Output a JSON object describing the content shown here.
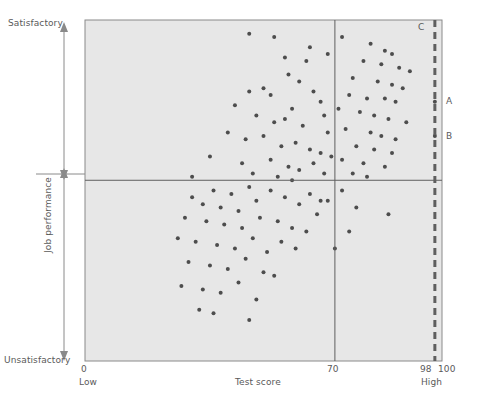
{
  "chart_data": {
    "type": "scatter",
    "title": "",
    "xlabel": "Test score",
    "ylabel": "Job performance",
    "xlim": [
      0,
      100
    ],
    "ylim": [
      0,
      100
    ],
    "grid": false,
    "legend_position": "none",
    "x_tick_labels": [
      "0",
      "70",
      "98",
      "100"
    ],
    "x_tick_values": [
      0,
      70,
      98,
      100
    ],
    "x_axis_low_label": "Low",
    "x_axis_high_label": "High",
    "y_axis_top_label": "Satisfactory",
    "y_axis_bottom_label": "Unsatisfactory",
    "reference_lines": [
      {
        "name": "cutoff-score-line",
        "orientation": "vertical",
        "value": 70,
        "style": "solid"
      },
      {
        "name": "performance-threshold-line",
        "orientation": "horizontal",
        "value": 53,
        "style": "solid"
      },
      {
        "name": "upper-score-line",
        "orientation": "vertical",
        "value": 98,
        "style": "dashed"
      }
    ],
    "annotations": [
      {
        "label": "A",
        "x": 98,
        "y": 76
      },
      {
        "label": "B",
        "x": 98,
        "y": 66
      },
      {
        "label": "C",
        "x": 95,
        "y": 99
      }
    ],
    "points": [
      [
        46,
        96
      ],
      [
        53,
        95
      ],
      [
        56,
        89
      ],
      [
        57,
        84
      ],
      [
        50,
        80
      ],
      [
        63,
        92
      ],
      [
        68,
        90
      ],
      [
        62,
        88
      ],
      [
        46,
        79
      ],
      [
        42,
        75
      ],
      [
        52,
        78
      ],
      [
        60,
        82
      ],
      [
        64,
        79
      ],
      [
        58,
        74
      ],
      [
        66,
        76
      ],
      [
        48,
        72
      ],
      [
        53,
        70
      ],
      [
        56,
        71
      ],
      [
        61,
        69
      ],
      [
        67,
        72
      ],
      [
        40,
        67
      ],
      [
        45,
        65
      ],
      [
        50,
        66
      ],
      [
        55,
        63
      ],
      [
        59,
        64
      ],
      [
        63,
        62
      ],
      [
        66,
        61
      ],
      [
        68,
        67
      ],
      [
        35,
        60
      ],
      [
        44,
        58
      ],
      [
        52,
        59
      ],
      [
        57,
        57
      ],
      [
        60,
        56
      ],
      [
        64,
        58
      ],
      [
        67,
        55
      ],
      [
        69,
        60
      ],
      [
        30,
        54
      ],
      [
        47,
        55
      ],
      [
        54,
        54
      ],
      [
        58,
        53
      ],
      [
        72,
        95
      ],
      [
        80,
        93
      ],
      [
        84,
        91
      ],
      [
        86,
        90
      ],
      [
        78,
        88
      ],
      [
        83,
        87
      ],
      [
        88,
        86
      ],
      [
        91,
        85
      ],
      [
        75,
        83
      ],
      [
        82,
        82
      ],
      [
        86,
        81
      ],
      [
        89,
        80
      ],
      [
        74,
        78
      ],
      [
        79,
        77
      ],
      [
        84,
        77
      ],
      [
        87,
        76
      ],
      [
        98,
        76
      ],
      [
        71,
        74
      ],
      [
        77,
        73
      ],
      [
        81,
        72
      ],
      [
        85,
        71
      ],
      [
        90,
        70
      ],
      [
        98,
        66
      ],
      [
        73,
        68
      ],
      [
        80,
        67
      ],
      [
        83,
        66
      ],
      [
        87,
        65
      ],
      [
        76,
        63
      ],
      [
        81,
        62
      ],
      [
        86,
        61
      ],
      [
        72,
        59
      ],
      [
        78,
        58
      ],
      [
        84,
        57
      ],
      [
        75,
        55
      ],
      [
        79,
        54
      ],
      [
        30,
        48
      ],
      [
        36,
        50
      ],
      [
        41,
        49
      ],
      [
        46,
        51
      ],
      [
        33,
        46
      ],
      [
        38,
        45
      ],
      [
        43,
        44
      ],
      [
        48,
        47
      ],
      [
        52,
        50
      ],
      [
        56,
        48
      ],
      [
        60,
        46
      ],
      [
        63,
        49
      ],
      [
        66,
        47
      ],
      [
        28,
        42
      ],
      [
        34,
        41
      ],
      [
        39,
        40
      ],
      [
        44,
        39
      ],
      [
        49,
        42
      ],
      [
        54,
        41
      ],
      [
        58,
        39
      ],
      [
        62,
        38
      ],
      [
        65,
        43
      ],
      [
        26,
        36
      ],
      [
        31,
        35
      ],
      [
        37,
        34
      ],
      [
        42,
        33
      ],
      [
        47,
        36
      ],
      [
        51,
        32
      ],
      [
        55,
        35
      ],
      [
        59,
        33
      ],
      [
        29,
        29
      ],
      [
        35,
        28
      ],
      [
        40,
        27
      ],
      [
        45,
        30
      ],
      [
        50,
        26
      ],
      [
        53,
        25
      ],
      [
        27,
        22
      ],
      [
        33,
        21
      ],
      [
        38,
        20
      ],
      [
        43,
        23
      ],
      [
        48,
        18
      ],
      [
        32,
        15
      ],
      [
        36,
        14
      ],
      [
        46,
        12
      ],
      [
        72,
        50
      ],
      [
        68,
        47
      ],
      [
        76,
        45
      ],
      [
        85,
        43
      ],
      [
        74,
        38
      ],
      [
        70,
        33
      ]
    ],
    "point_color": "#4d4d4d",
    "plot_bg_color": "#e7e7e7",
    "axis_color": "#6b6b6b"
  }
}
